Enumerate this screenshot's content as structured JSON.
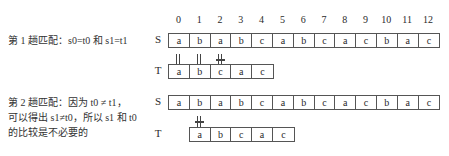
{
  "indices": [
    "0",
    "1",
    "2",
    "3",
    "4",
    "5",
    "6",
    "7",
    "8",
    "9",
    "10",
    "11",
    "12"
  ],
  "S": [
    "a",
    "b",
    "a",
    "b",
    "c",
    "a",
    "b",
    "c",
    "a",
    "c",
    "b",
    "a",
    "c"
  ],
  "T": [
    "a",
    "b",
    "c",
    "a",
    "c"
  ],
  "pass1": {
    "description": "第 1 趟匹配：s0=t0 和 s1=t1",
    "s_label": "S",
    "t_label": "T",
    "t_offset": 0,
    "marks": [
      "equal",
      "equal",
      "not-equal"
    ]
  },
  "pass2": {
    "description_lines": [
      "第 2 趟匹配：因为 t0 ≠ t1，",
      "可以得出 s1≠t0，所以 s1 和 t0",
      "的比较是不必要的"
    ],
    "s_label": "S",
    "t_label": "T",
    "t_offset": 1,
    "marks": [
      "not-equal"
    ]
  }
}
